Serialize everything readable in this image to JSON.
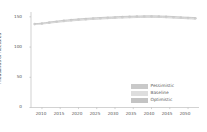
{
  "chart_data": {
    "type": "line",
    "title": "",
    "xlabel": "",
    "ylabel": "Thousands of hectares",
    "xlim": [
      2007,
      2053
    ],
    "ylim": [
      0,
      158
    ],
    "grid": false,
    "legend_position": "lower right",
    "x": [
      2008,
      2009,
      2010,
      2011,
      2012,
      2013,
      2014,
      2015,
      2016,
      2017,
      2018,
      2019,
      2020,
      2021,
      2022,
      2023,
      2024,
      2025,
      2026,
      2027,
      2028,
      2029,
      2030,
      2031,
      2032,
      2033,
      2034,
      2035,
      2036,
      2037,
      2038,
      2039,
      2040,
      2041,
      2042,
      2043,
      2044,
      2045,
      2046,
      2047,
      2048,
      2049,
      2050,
      2051,
      2052
    ],
    "series": [
      {
        "name": "Pessimistic",
        "color": "#c9c9c9",
        "values": [
          137.5,
          137.8,
          138.2,
          138.8,
          139.5,
          140.2,
          140.9,
          141.5,
          142.1,
          142.7,
          143.2,
          143.7,
          144.2,
          144.6,
          145.0,
          145.4,
          145.8,
          146.1,
          146.4,
          146.7,
          147.0,
          147.3,
          147.6,
          147.9,
          148.1,
          148.3,
          148.5,
          148.7,
          148.9,
          149.0,
          149.1,
          149.2,
          149.2,
          149.1,
          149.0,
          148.8,
          148.6,
          148.3,
          148.0,
          147.7,
          147.4,
          147.1,
          146.8,
          146.5,
          146.2
        ]
      },
      {
        "name": "Baseline",
        "color": "#dedede",
        "values": [
          138.0,
          138.4,
          138.9,
          139.6,
          140.4,
          141.2,
          141.9,
          142.6,
          143.2,
          143.8,
          144.4,
          144.9,
          145.4,
          145.8,
          146.2,
          146.6,
          147.0,
          147.4,
          147.7,
          148.0,
          148.3,
          148.6,
          148.9,
          149.2,
          149.4,
          149.6,
          149.8,
          150.0,
          150.2,
          150.3,
          150.4,
          150.5,
          150.5,
          150.4,
          150.3,
          150.1,
          149.9,
          149.6,
          149.3,
          149.0,
          148.7,
          148.4,
          148.1,
          147.8,
          147.5
        ]
      },
      {
        "name": "Optimistic",
        "color": "#c4c4c4",
        "values": [
          138.5,
          139.0,
          139.6,
          140.4,
          141.3,
          142.1,
          142.9,
          143.6,
          144.3,
          144.9,
          145.5,
          146.0,
          146.5,
          147.0,
          147.4,
          147.8,
          148.2,
          148.6,
          148.9,
          149.2,
          149.5,
          149.8,
          150.1,
          150.4,
          150.6,
          150.8,
          151.0,
          151.2,
          151.4,
          151.5,
          151.6,
          151.7,
          151.7,
          151.6,
          151.5,
          151.3,
          151.1,
          150.8,
          150.5,
          150.2,
          149.9,
          149.6,
          149.3,
          149.0,
          148.7
        ]
      }
    ],
    "yticks": [
      0,
      50,
      100,
      150
    ],
    "ytick_labels": [
      "0",
      "50",
      "100",
      "150"
    ],
    "xticks": [
      2010,
      2015,
      2020,
      2025,
      2030,
      2035,
      2040,
      2045,
      2050
    ],
    "xtick_labels": [
      "2010",
      "2015",
      "2020",
      "2025",
      "2030",
      "2035",
      "2040",
      "2045",
      "2050"
    ]
  },
  "legend": {
    "items": [
      {
        "label": "Pessimistic",
        "color": "#c9c9c9"
      },
      {
        "label": "Baseline",
        "color": "#dedede"
      },
      {
        "label": "Optimistic",
        "color": "#c4c4c4"
      }
    ]
  },
  "axes": {
    "y_title": "Thousands of hectares",
    "spine_color": "#b0b0b0"
  }
}
